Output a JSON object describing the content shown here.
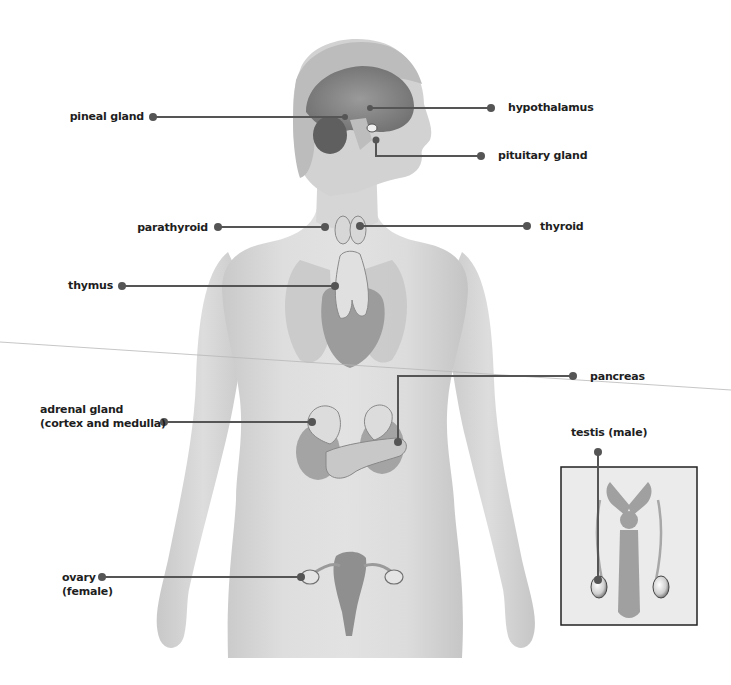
{
  "diagram": {
    "colors": {
      "background": "#ffffff",
      "body_skin": "#d9d9d9",
      "body_shadow": "#bdbdbd",
      "organ": "#9a9a9a",
      "organ_dark": "#7a7a7a",
      "leader_line": "#555555",
      "leader_dot": "#555555",
      "label_text": "#1e1e1e",
      "inset_border": "#222222",
      "inset_fill": "#ececec"
    },
    "labels": {
      "pineal_gland": "pineal gland",
      "hypothalamus": "hypothalamus",
      "pituitary_gland": "pituitary gland",
      "parathyroid": "parathyroid",
      "thyroid": "thyroid",
      "thymus": "thymus",
      "pancreas": "pancreas",
      "adrenal_gland_line1": "adrenal gland",
      "adrenal_gland_line2": "(cortex and medulla)",
      "testis": "testis (male)",
      "ovary_line1": "ovary",
      "ovary_line2": "(female)"
    },
    "inset": {
      "title": "testis (male)",
      "content": "male reproductive organs"
    }
  }
}
